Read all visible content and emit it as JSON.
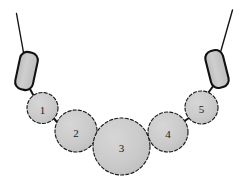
{
  "figure": {
    "width": 247,
    "height": 186,
    "background_color": "#ffffff"
  },
  "colors": {
    "bead_fill": "#c9c9c9",
    "bead_fill_light": "#d0d0d0",
    "bead_outline": "#1c1c1c",
    "tube_outline": "#111111",
    "thread": "#151515",
    "label_text": "#1a1a1a"
  },
  "round_beads": [
    {
      "id": "bead-1",
      "label": "1",
      "cx": 42.5,
      "cy": 108.0,
      "r": 15.5,
      "label_x": 42.5,
      "label_y": 109.5
    },
    {
      "id": "bead-2",
      "label": "2",
      "cx": 76.0,
      "cy": 131.0,
      "r": 21.0,
      "label_x": 76.0,
      "label_y": 132.5
    },
    {
      "id": "bead-3",
      "label": "3",
      "cx": 121.5,
      "cy": 146.5,
      "r": 28.5,
      "label_x": 121.5,
      "label_y": 148.0
    },
    {
      "id": "bead-4",
      "label": "4",
      "cx": 168.0,
      "cy": 132.0,
      "r": 20.0,
      "label_x": 168.0,
      "label_y": 133.5
    },
    {
      "id": "bead-5",
      "label": "5",
      "cx": 201.5,
      "cy": 107.5,
      "r": 16.5,
      "label_x": 201.5,
      "label_y": 109.0
    }
  ],
  "tube_beads": [
    {
      "id": "tube-bead-left",
      "x": -9.0,
      "y": -19.0,
      "width": 18.0,
      "height": 38.0,
      "corner_radius": 7.5,
      "translate_x": 26.5,
      "translate_y": 71.0,
      "rotation_deg": 12
    },
    {
      "id": "tube-bead-right",
      "x": -9.0,
      "y": -19.0,
      "width": 18.0,
      "height": 38.0,
      "corner_radius": 7.5,
      "translate_x": 217.0,
      "translate_y": 69.0,
      "rotation_deg": -14
    }
  ],
  "threads": [
    {
      "id": "thread-left",
      "d": "M 16.5 13.5 L 23.5 52.5",
      "width": 1.4
    },
    {
      "id": "thread-right",
      "d": "M 232.5 10.0 L 221.0 50.5",
      "width": 1.4
    }
  ],
  "connectors": [
    {
      "id": "connector-left-tube-to-bead-1",
      "d": "M 30.0 89.0 L 33.5 95.5",
      "width": 2.0
    },
    {
      "id": "connector-bead-1-to-bead-2",
      "d": "M 54.0 118.5 L 58.5 124.0",
      "width": 2.0
    },
    {
      "id": "connector-bead-2-to-bead-3",
      "d": "M 94.5 140.5 L 100.5 144.5",
      "width": 2.0
    },
    {
      "id": "connector-bead-3-to-bead-4",
      "d": "M 147.0 141.0 L 152.5 138.5",
      "width": 2.0
    },
    {
      "id": "connector-bead-4-to-bead-5",
      "d": "M 184.0 121.5 L 189.5 117.5",
      "width": 2.0
    },
    {
      "id": "connector-bead-5-to-right-tube",
      "d": "M 208.5 92.5 L 212.5 87.0",
      "width": 2.0
    }
  ]
}
